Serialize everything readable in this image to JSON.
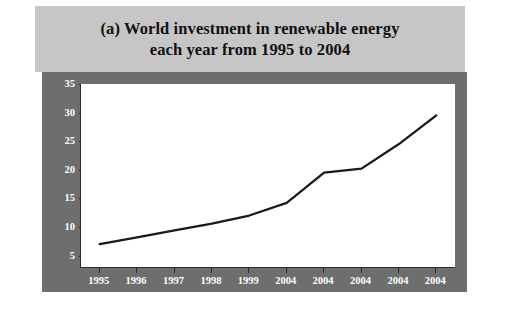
{
  "figure": {
    "title_lines": [
      "(a) World investment in renewable energy",
      "each year from 1995 to 2004"
    ],
    "panel_color": "#6e6e6e",
    "title_band_color": "#c6c6c6",
    "line_color": "#1a1a1a",
    "plot_background": "#ffffff"
  },
  "chart_data": {
    "type": "line",
    "title": "(a) World investment in renewable energy each year from 1995 to 2004",
    "xlabel": "",
    "ylabel": "Billion Dollars",
    "categories": [
      "1995",
      "1996",
      "1997",
      "1998",
      "1999",
      "2004",
      "2004",
      "2004",
      "2004",
      "2004"
    ],
    "x_tick_labels": [
      "1995",
      "1996",
      "1997",
      "1998",
      "1999",
      "2004",
      "2004",
      "2004",
      "2004",
      "2004"
    ],
    "y_tick_labels": [
      "5",
      "10",
      "15",
      "20",
      "25",
      "30",
      "35"
    ],
    "y_ticks": [
      5,
      10,
      15,
      20,
      25,
      30,
      35
    ],
    "ylim": [
      3,
      35
    ],
    "values": [
      7.0,
      8.2,
      9.4,
      10.6,
      12.0,
      14.2,
      19.5,
      20.2,
      24.5,
      29.5
    ],
    "series": [
      {
        "name": "World investment in renewable energy",
        "values": [
          7.0,
          8.2,
          9.4,
          10.6,
          12.0,
          14.2,
          19.5,
          20.2,
          24.5,
          29.5
        ]
      }
    ],
    "grid": false,
    "legend": false,
    "legend_position": "none",
    "units": "Billion Dollars"
  }
}
